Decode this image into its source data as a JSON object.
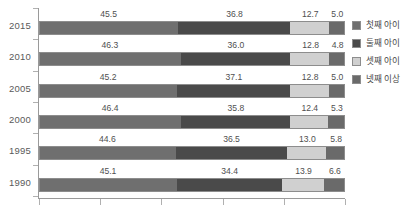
{
  "chart_data": {
    "type": "bar",
    "orientation": "horizontal",
    "stacked": true,
    "normalized_percent": true,
    "title": "",
    "subtitle": "",
    "xlabel": "",
    "ylabel": "",
    "xlim": [
      0,
      100
    ],
    "grid": false,
    "legend_position": "right",
    "categories": [
      "2015",
      "2010",
      "2005",
      "2000",
      "1995",
      "1990"
    ],
    "series": [
      {
        "name": "첫째 아이",
        "color": "#6f6f6f",
        "values": [
          45.5,
          46.3,
          45.2,
          46.4,
          44.6,
          45.1
        ]
      },
      {
        "name": "둘째 아이",
        "color": "#4a4a4a",
        "values": [
          36.8,
          36.0,
          37.1,
          35.8,
          36.5,
          34.4
        ]
      },
      {
        "name": "셋째 아이",
        "color": "#d0d0d0",
        "values": [
          12.7,
          12.8,
          12.8,
          12.4,
          13.0,
          13.9
        ]
      },
      {
        "name": "넷째 이상",
        "color": "#6a6a6a",
        "values": [
          5.0,
          4.8,
          5.0,
          5.3,
          5.8,
          6.6
        ]
      }
    ],
    "data_labels": [
      {
        "category": "2015",
        "labels": [
          "45.5",
          "36.8",
          "12.7",
          "5.0"
        ]
      },
      {
        "category": "2010",
        "labels": [
          "46.3",
          "36.0",
          "12.8",
          "4.8"
        ]
      },
      {
        "category": "2005",
        "labels": [
          "45.2",
          "37.1",
          "12.8",
          "5.0"
        ]
      },
      {
        "category": "2000",
        "labels": [
          "46.4",
          "35.8",
          "12.4",
          "5.3"
        ]
      },
      {
        "category": "1995",
        "labels": [
          "44.6",
          "36.5",
          "13.0",
          "5.8"
        ]
      },
      {
        "category": "1990",
        "labels": [
          "45.1",
          "34.4",
          "13.9",
          "6.6"
        ]
      }
    ],
    "x_tick_count": 6,
    "x_tick_labels": []
  },
  "axis": {
    "y_labels": [
      "2015",
      "2010",
      "2005",
      "2000",
      "1995",
      "1990"
    ]
  },
  "legend": {
    "items": [
      {
        "label": "첫째 아이"
      },
      {
        "label": "둘째 아이"
      },
      {
        "label": "셋째 아이"
      },
      {
        "label": "넷째 이상"
      }
    ]
  }
}
